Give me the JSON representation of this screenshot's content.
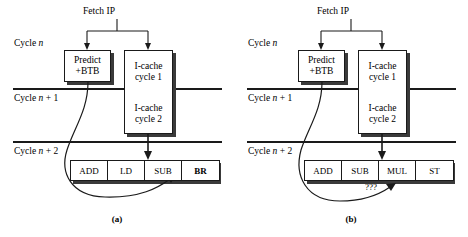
{
  "figure": {
    "panels": [
      {
        "id": "a",
        "caption": "(a)",
        "fetch_label": "Fetch IP",
        "cycle_labels": {
          "n": "Cycle n",
          "n_plus_1": "Cycle n + 1",
          "n_plus_2": "Cycle n + 2"
        },
        "cycle_label_parts": {
          "n": {
            "prefix": "Cycle ",
            "var": "n",
            "suffix": ""
          },
          "n_plus_1": {
            "prefix": "Cycle ",
            "var": "n",
            "suffix": " + 1"
          },
          "n_plus_2": {
            "prefix": "Cycle ",
            "var": "n",
            "suffix": " + 2"
          }
        },
        "predict_box": {
          "line1": "Predict",
          "line2": "+BTB"
        },
        "icache_box": {
          "top": {
            "line1": "I-cache",
            "line2": "cycle 1"
          },
          "bottom": {
            "line1": "I-cache",
            "line2": "cycle 2"
          }
        },
        "instructions": [
          {
            "label": "ADD",
            "bold": false
          },
          {
            "label": "LD",
            "bold": false
          },
          {
            "label": "SUB",
            "bold": false
          },
          {
            "label": "BR",
            "bold": true
          }
        ],
        "annotation": ""
      },
      {
        "id": "b",
        "caption": "(b)",
        "fetch_label": "Fetch IP",
        "cycle_labels": {
          "n": "Cycle n",
          "n_plus_1": "Cycle n + 1",
          "n_plus_2": "Cycle n + 2"
        },
        "cycle_label_parts": {
          "n": {
            "prefix": "Cycle ",
            "var": "n",
            "suffix": ""
          },
          "n_plus_1": {
            "prefix": "Cycle ",
            "var": "n",
            "suffix": " + 1"
          },
          "n_plus_2": {
            "prefix": "Cycle ",
            "var": "n",
            "suffix": " + 2"
          }
        },
        "predict_box": {
          "line1": "Predict",
          "line2": "+BTB"
        },
        "icache_box": {
          "top": {
            "line1": "I-cache",
            "line2": "cycle 1"
          },
          "bottom": {
            "line1": "I-cache",
            "line2": "cycle 2"
          }
        },
        "instructions": [
          {
            "label": "ADD",
            "bold": false
          },
          {
            "label": "SUB",
            "bold": false
          },
          {
            "label": "MUL",
            "bold": false
          },
          {
            "label": "ST",
            "bold": false
          }
        ],
        "annotation": "???"
      }
    ],
    "colors": {
      "line": "#1a1a1a",
      "shadow": "#3a3a3a",
      "background": "#ffffff",
      "text": "#000000"
    }
  }
}
